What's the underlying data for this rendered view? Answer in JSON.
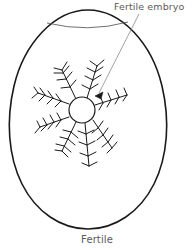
{
  "figure": {
    "caption": "Fertile",
    "callout_label": "Fertile embryo",
    "colors": {
      "egg_outline": "#1a1a1a",
      "air_cell_line": "#5f5f5f",
      "embryo_stroke": "#1a1a1a",
      "leader_line": "#7a7a7a",
      "text": "#5a5a5a",
      "background": "#ffffff"
    },
    "egg": {
      "shape": "ovoid",
      "center_x": 88,
      "top_y": 10,
      "bottom_y": 229,
      "left_x": 11,
      "right_x": 165,
      "stroke_width": 1.6
    },
    "air_cell": {
      "present": true,
      "arc_left_x": 47,
      "arc_right_x": 128,
      "arc_y": 24,
      "stroke_width": 0.9
    },
    "embryo": {
      "center_x": 82,
      "center_y": 110,
      "radius": 13,
      "arm_count": 8,
      "arm_angles_deg": [
        70,
        115,
        160,
        200,
        248,
        290,
        330,
        22
      ],
      "arm_lengths": [
        44,
        40,
        40,
        40,
        44,
        42,
        40,
        38
      ],
      "barb_count_per_arm": 5,
      "stroke_width": 1.0,
      "description": "central blastoderm disc with radiating feathered blood vessels"
    },
    "leader_line": {
      "from_x": 139,
      "from_y": 14,
      "to_x": 96,
      "to_y": 96,
      "arrowhead": "filled-triangle",
      "stroke_width": 0.8
    }
  }
}
